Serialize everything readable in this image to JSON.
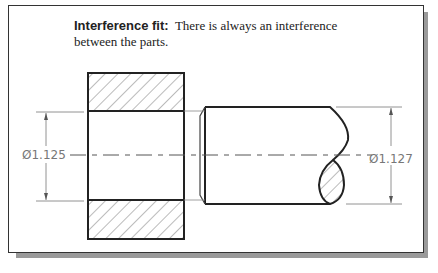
{
  "caption": {
    "term": "Interference fit:",
    "line1_rest": "There is always an interference",
    "line2": "between the parts."
  },
  "dimensions": {
    "hole": "Ø1.125",
    "shaft": "Ø1.127"
  },
  "colors": {
    "outline": "#222222",
    "dimension": "#777777",
    "shadow": "#9a9a9a"
  }
}
